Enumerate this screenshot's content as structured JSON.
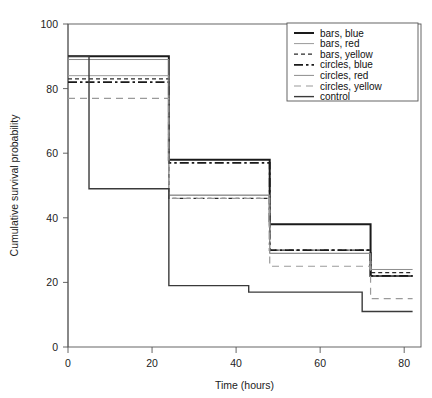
{
  "chart_data": {
    "type": "line",
    "subtype": "step-kaplan-meier",
    "title": "",
    "xlabel": "Time (hours)",
    "ylabel": "Cumulative survival probability",
    "xlim": [
      0,
      84
    ],
    "ylim": [
      0,
      100
    ],
    "xticks": [
      0,
      20,
      40,
      60,
      80
    ],
    "yticks": [
      0,
      20,
      40,
      60,
      80,
      100
    ],
    "xticklabels": [
      "0",
      "20",
      "40",
      "60",
      "80"
    ],
    "yticklabels": [
      "0",
      "20",
      "40",
      "60",
      "80",
      "100"
    ],
    "grid": false,
    "legend_position": "upper right",
    "step_times": [
      0,
      24,
      48,
      72,
      82
    ],
    "series": [
      {
        "name": "bars, blue",
        "style": "solid",
        "width": 2.0,
        "color": "#1a1a1a",
        "x": [
          0,
          24,
          48,
          72,
          82
        ],
        "values": [
          90,
          58,
          38,
          22,
          22
        ]
      },
      {
        "name": "bars, red",
        "style": "solid",
        "width": 1.0,
        "color": "#9a9a9a",
        "x": [
          0,
          24,
          48,
          72,
          82
        ],
        "values": [
          84,
          47,
          29,
          22,
          22
        ]
      },
      {
        "name": "bars, yellow",
        "style": "dotted",
        "width": 1.2,
        "color": "#2b2b2b",
        "x": [
          0,
          24,
          48,
          72,
          82
        ],
        "values": [
          83,
          46,
          30,
          23,
          23
        ]
      },
      {
        "name": "circles, blue",
        "style": "dashdot",
        "width": 1.8,
        "color": "#1a1a1a",
        "x": [
          0,
          24,
          48,
          72,
          82
        ],
        "values": [
          82,
          57,
          30,
          22,
          22
        ]
      },
      {
        "name": "circles, red",
        "style": "solid",
        "width": 1.0,
        "color": "#8c8c8c",
        "x": [
          0,
          24,
          48,
          72,
          82
        ],
        "values": [
          89,
          47,
          29,
          24,
          24
        ]
      },
      {
        "name": "circles, yellow",
        "style": "dashed",
        "width": 1.2,
        "color": "#9a9a9a",
        "x": [
          0,
          24,
          48,
          72,
          82
        ],
        "values": [
          77,
          46,
          25,
          15,
          15
        ]
      },
      {
        "name": "control",
        "style": "solid",
        "width": 1.4,
        "color": "#3a3a3a",
        "x": [
          0,
          5,
          24,
          43,
          70,
          82
        ],
        "values": [
          90,
          49,
          19,
          17,
          11,
          11
        ]
      }
    ]
  },
  "legend": {
    "entries": [
      {
        "label": "bars, blue"
      },
      {
        "label": "bars, red"
      },
      {
        "label": "bars, yellow"
      },
      {
        "label": "circles, blue"
      },
      {
        "label": "circles, red"
      },
      {
        "label": "circles, yellow"
      },
      {
        "label": "control"
      }
    ]
  }
}
